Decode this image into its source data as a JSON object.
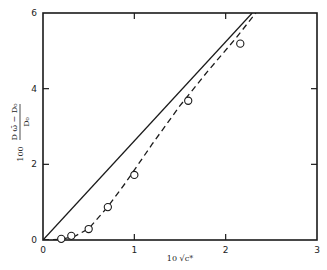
{
  "chart_data": {
    "type": "scatter",
    "title": "",
    "xlabel": "10 √c*",
    "ylabel": "100 (D_ω̄ − D₀)/D₀",
    "ylabel_parts": {
      "prefix": "100",
      "numerator": "D ω̄ − D₀",
      "denominator": "D₀"
    },
    "xlim": [
      0,
      3
    ],
    "ylim": [
      0,
      6
    ],
    "x_ticks": [
      0,
      1,
      2,
      3
    ],
    "y_ticks": [
      0,
      2,
      4,
      6
    ],
    "x_tick_labels": [
      "0",
      "1",
      "2",
      "3"
    ],
    "y_tick_labels": [
      "0",
      "2",
      "4",
      "6"
    ],
    "grid": false,
    "legend": null,
    "series": [
      {
        "name": "measured",
        "style": "open-circle",
        "x": [
          0.2,
          0.31,
          0.5,
          0.71,
          1.0,
          1.59,
          2.16
        ],
        "y": [
          0.03,
          0.11,
          0.29,
          0.87,
          1.72,
          3.68,
          5.19
        ]
      },
      {
        "name": "limiting-law",
        "style": "solid-line",
        "x": [
          0,
          2.29
        ],
        "y": [
          0,
          6
        ]
      },
      {
        "name": "theory-curve",
        "style": "dashed-line",
        "x": [
          0,
          0.2,
          0.35,
          0.5,
          0.7,
          0.9,
          1.2,
          1.5,
          1.8,
          2.1,
          2.33
        ],
        "y": [
          0,
          0.02,
          0.1,
          0.3,
          0.85,
          1.5,
          2.55,
          3.55,
          4.45,
          5.3,
          6
        ]
      }
    ]
  }
}
